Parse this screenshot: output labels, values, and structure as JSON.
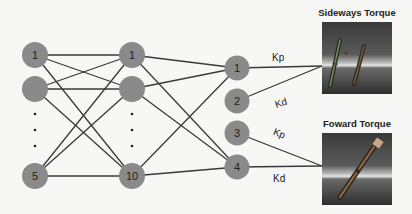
{
  "input_layer": {
    "nodes": [
      {
        "label": "1",
        "y": 55
      },
      {
        "label": "",
        "y": 89
      },
      {
        "label": "5",
        "y": 176
      }
    ],
    "x": 35,
    "ellipsis_dots_y": [
      114,
      130,
      146
    ]
  },
  "hidden_layer": {
    "nodes": [
      {
        "label": "1",
        "y": 55
      },
      {
        "label": "",
        "y": 89
      },
      {
        "label": "10",
        "y": 176
      }
    ],
    "x": 132,
    "ellipsis_dots_y": [
      114,
      130,
      146
    ]
  },
  "output_layer": {
    "nodes": [
      {
        "label": "1",
        "y": 68
      },
      {
        "label": "2",
        "y": 101
      },
      {
        "label": "3",
        "y": 133
      },
      {
        "label": "4",
        "y": 167
      }
    ],
    "x": 237
  },
  "edge_labels": {
    "out1": "Kp",
    "out2": "Kd",
    "out3": "Kp",
    "out4": "Kd"
  },
  "images": {
    "sideways": {
      "title": "Sideways Torque"
    },
    "forward": {
      "title": "Foward Torque"
    }
  },
  "colors": {
    "node_fill": "#8a8a8a",
    "edge": "#3a3a3a",
    "background": "#f7f7f5"
  }
}
